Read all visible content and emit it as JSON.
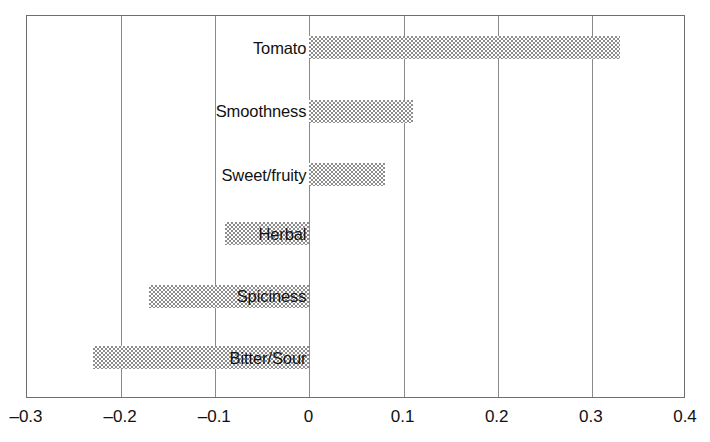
{
  "chart_data": {
    "type": "bar",
    "orientation": "horizontal",
    "title": "",
    "xlabel": "",
    "ylabel": "",
    "xlim": [
      -0.3,
      0.4
    ],
    "grid": true,
    "legend": false,
    "xticks": [
      "–0.3",
      "–0.2",
      "–0.1",
      "0",
      "0.1",
      "0.2",
      "0.3",
      "0.4"
    ],
    "xtick_values": [
      -0.3,
      -0.2,
      -0.1,
      0,
      0.1,
      0.2,
      0.3,
      0.4
    ],
    "categories": [
      "Tomato",
      "Smoothness",
      "Sweet/fruity",
      "Herbal",
      "Spiciness",
      "Bitter/Sour"
    ],
    "values": [
      0.33,
      0.11,
      0.08,
      -0.09,
      -0.17,
      -0.23
    ],
    "bar_color": "#8d8d8d",
    "bar_pattern": "checkerboard-dither",
    "axis_color": "#6e6e6e",
    "gridline_color": "#8a8a8a",
    "bars": [
      {
        "label": "Tomato",
        "value": 0.33,
        "label_position": "left-of-axis"
      },
      {
        "label": "Smoothness",
        "value": 0.11,
        "label_position": "left-of-axis"
      },
      {
        "label": "Sweet/fruity",
        "value": 0.08,
        "label_position": "left-of-axis"
      },
      {
        "label": "Herbal",
        "value": -0.09,
        "label_position": "over-bar"
      },
      {
        "label": "Spiciness",
        "value": -0.17,
        "label_position": "over-bar"
      },
      {
        "label": "Bitter/Sour",
        "value": -0.23,
        "label_position": "over-bar"
      }
    ]
  }
}
